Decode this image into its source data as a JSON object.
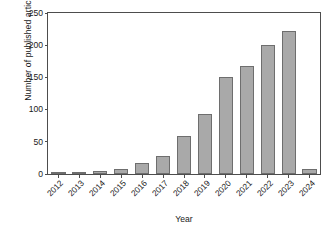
{
  "chart_data": {
    "type": "bar",
    "title": "",
    "xlabel": "Year",
    "ylabel": "Number of published articles",
    "categories": [
      "2012",
      "2013",
      "2014",
      "2015",
      "2016",
      "2017",
      "2018",
      "2019",
      "2020",
      "2021",
      "2022",
      "2023",
      "2024"
    ],
    "values": [
      1,
      1,
      4,
      8,
      17,
      28,
      59,
      93,
      151,
      167,
      200,
      222,
      8
    ],
    "ylim": [
      0,
      250
    ],
    "yticks": [
      0,
      50,
      100,
      150,
      200,
      250
    ],
    "ytick_labels": [
      "0",
      "50",
      "100",
      "150",
      "200",
      "250"
    ],
    "grid": false,
    "legend": null,
    "legend_position": "none",
    "xtick_rotation": -45,
    "bar_color": "#a9a9a9",
    "bar_edge_color": "#6e6e6e",
    "axis_color": "#4d4d4d",
    "text_color": "#1a1a1a",
    "background_color": "#ffffff"
  }
}
